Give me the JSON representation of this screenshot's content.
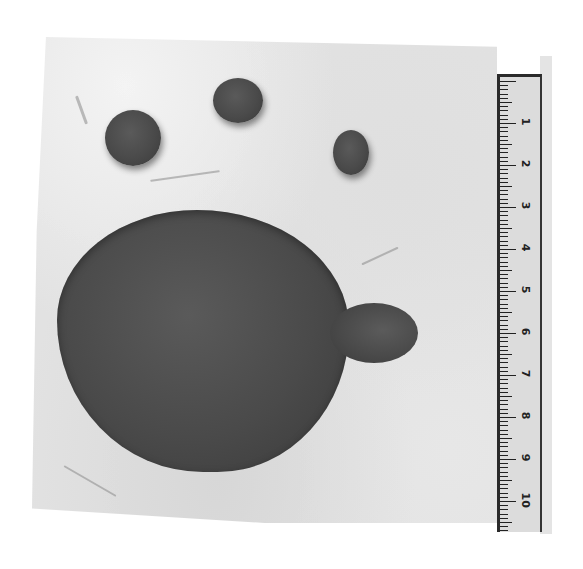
{
  "image": {
    "description": "Grayscale photograph of a fossil animal footprint (paw print) in rock with a measuring scale",
    "colors": {
      "background": "#ffffff",
      "rock": "#d9d9d9",
      "print": "#4a4a4a",
      "ruler": "#dcdcdc"
    }
  },
  "footprint": {
    "toes": [
      {
        "name": "left-toe",
        "x": 105,
        "y": 110,
        "w": 56,
        "h": 56
      },
      {
        "name": "middle-toe",
        "x": 213,
        "y": 78,
        "w": 50,
        "h": 45
      },
      {
        "name": "right-toe",
        "x": 333,
        "y": 130,
        "w": 36,
        "h": 45
      }
    ],
    "main_pad": {
      "x": 57,
      "y": 210,
      "w": 292,
      "h": 262
    }
  },
  "ruler": {
    "labels": [
      "1",
      "2",
      "3",
      "4",
      "5",
      "6",
      "7",
      "8",
      "9",
      "10"
    ],
    "unit": "cm"
  }
}
